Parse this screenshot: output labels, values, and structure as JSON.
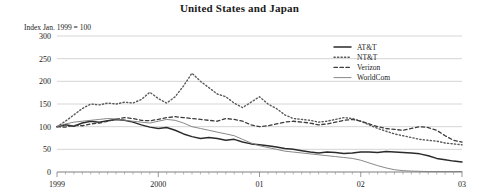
{
  "chart_data": {
    "type": "line",
    "title": "United States and Japan",
    "subtitle": "Index Jan. 1999 = 100",
    "xlabel": "",
    "ylabel": "Index Jan. 1999 = 100",
    "ylim": [
      0,
      300
    ],
    "yticks": [
      0,
      50,
      100,
      150,
      200,
      250,
      300
    ],
    "ytick_labels": [
      "0",
      "50",
      "100",
      "150",
      "200",
      "250",
      "300"
    ],
    "grid": true,
    "legend_position": "top-right",
    "xlim": [
      1999.0,
      2003.0
    ],
    "xticks": [
      1999.0,
      2000.0,
      2001.0,
      2002.0,
      2003.0
    ],
    "xtick_labels": [
      "1999",
      "2000",
      "01",
      "02",
      "03"
    ],
    "x": [
      1999.0,
      1999.083,
      1999.167,
      1999.25,
      1999.333,
      1999.417,
      1999.5,
      1999.583,
      1999.667,
      1999.75,
      1999.833,
      1999.917,
      2000.0,
      2000.083,
      2000.167,
      2000.25,
      2000.333,
      2000.417,
      2000.5,
      2000.583,
      2000.667,
      2000.75,
      2000.833,
      2000.917,
      2001.0,
      2001.083,
      2001.167,
      2001.25,
      2001.333,
      2001.417,
      2001.5,
      2001.583,
      2001.667,
      2001.75,
      2001.833,
      2001.917,
      2002.0,
      2002.083,
      2002.167,
      2002.25,
      2002.333,
      2002.417,
      2002.5,
      2002.583,
      2002.667,
      2002.75,
      2002.833,
      2002.917,
      2003.0
    ],
    "series": [
      {
        "name": "AT&T",
        "style": "solid",
        "width": 1.5,
        "color": "#2b2b2b",
        "values": [
          100,
          104,
          101,
          108,
          112,
          110,
          113,
          116,
          114,
          110,
          104,
          99,
          96,
          98,
          92,
          84,
          78,
          74,
          76,
          74,
          70,
          72,
          66,
          62,
          60,
          58,
          55,
          52,
          50,
          47,
          44,
          42,
          44,
          43,
          41,
          42,
          44,
          44,
          43,
          45,
          44,
          43,
          42,
          40,
          36,
          30,
          27,
          24,
          22
        ]
      },
      {
        "name": "NT&T",
        "style": "dotted",
        "width": 1.4,
        "color": "#5a5a5a",
        "values": [
          100,
          112,
          126,
          140,
          150,
          148,
          152,
          150,
          154,
          152,
          160,
          176,
          162,
          152,
          166,
          190,
          218,
          200,
          186,
          172,
          166,
          152,
          142,
          154,
          166,
          150,
          140,
          126,
          118,
          116,
          114,
          110,
          112,
          116,
          120,
          118,
          112,
          104,
          96,
          90,
          84,
          80,
          76,
          72,
          70,
          68,
          64,
          62,
          60
        ]
      },
      {
        "name": "Verizon",
        "style": "dashed",
        "width": 1.3,
        "color": "#3c3c3c",
        "values": [
          100,
          99,
          103,
          102,
          106,
          108,
          112,
          116,
          120,
          118,
          114,
          113,
          116,
          120,
          122,
          120,
          118,
          116,
          114,
          112,
          118,
          116,
          112,
          104,
          100,
          102,
          106,
          110,
          112,
          110,
          108,
          104,
          106,
          110,
          114,
          116,
          112,
          106,
          100,
          96,
          94,
          92,
          96,
          100,
          98,
          92,
          80,
          70,
          66
        ]
      },
      {
        "name": "WorldCom",
        "style": "solid",
        "width": 0.9,
        "color": "#7a7a7a",
        "values": [
          100,
          106,
          110,
          112,
          114,
          116,
          118,
          117,
          114,
          112,
          110,
          108,
          112,
          116,
          114,
          108,
          100,
          96,
          92,
          88,
          84,
          80,
          72,
          64,
          58,
          54,
          50,
          46,
          44,
          42,
          40,
          38,
          36,
          34,
          32,
          30,
          26,
          20,
          14,
          9,
          5,
          3,
          2,
          1.5,
          1,
          1,
          1,
          1,
          1
        ]
      }
    ]
  },
  "legend": {
    "items": [
      {
        "label": "AT&T"
      },
      {
        "label": "NT&T"
      },
      {
        "label": "Verizon"
      },
      {
        "label": "WorldCom"
      }
    ]
  }
}
